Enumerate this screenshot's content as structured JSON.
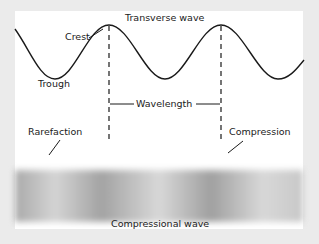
{
  "title": "Transverse wave",
  "transverse": {
    "labels": {
      "crest": "Crest",
      "trough": "Trough",
      "wavelength": "Wavelength"
    }
  },
  "compressional": {
    "title": "Compressional wave",
    "labels": {
      "rarefaction": "Rarefaction",
      "compression": "Compression"
    },
    "band_stops": [
      {
        "pos": 0,
        "color": "#aaaaaa"
      },
      {
        "pos": 14,
        "color": "#d4d4d4"
      },
      {
        "pos": 30,
        "color": "#a3a3a3"
      },
      {
        "pos": 50,
        "color": "#d8d8d8"
      },
      {
        "pos": 68,
        "color": "#a0a0a0"
      },
      {
        "pos": 86,
        "color": "#d8d8d8"
      },
      {
        "pos": 100,
        "color": "#c8c8c8"
      }
    ]
  },
  "colors": {
    "background": "#ebebeb",
    "panel": "#ffffff",
    "ink": "#1a1a1a"
  }
}
